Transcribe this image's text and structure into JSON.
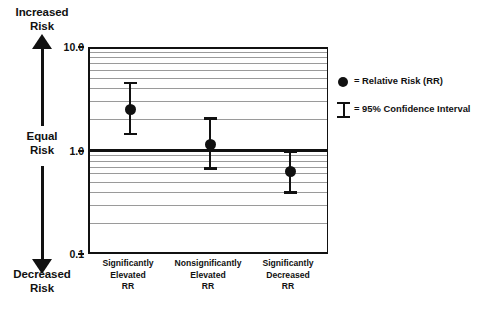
{
  "risk_axis": {
    "top_label": "Increased\nRisk",
    "top_label_line1": "Increased",
    "top_label_line2": "Risk",
    "mid_label_line1": "Equal",
    "mid_label_line2": "Risk",
    "bottom_label_line1": "Decreased",
    "bottom_label_line2": "Risk"
  },
  "legend": {
    "position": "right",
    "items": [
      {
        "symbol": "filled-circle",
        "label": "= Relative Risk (RR)"
      },
      {
        "symbol": "i-bar",
        "label": "= 95% Confidence Interval"
      }
    ]
  },
  "colors": {
    "ink": "#111111",
    "gridline": "#9a9a9a",
    "background": "#ffffff"
  },
  "chart_data": {
    "type": "scatter",
    "title": "",
    "subtitle": "",
    "xlabel": "",
    "ylabel": "",
    "scale": "log",
    "ylim": [
      0.1,
      10.0
    ],
    "grid": true,
    "reference_line": 1.0,
    "ytick_labels": [
      "10.0",
      "1.0",
      "0.1"
    ],
    "ytick_values": [
      10.0,
      1.0,
      0.1
    ],
    "categories": [
      "Significantly\nElevated\nRR",
      "Nonsignificantly\nElevated\nRR",
      "Significantly\nDecreased\nRR"
    ],
    "category_lines": [
      [
        "Significantly",
        "Elevated",
        "RR"
      ],
      [
        "Nonsignificantly",
        "Elevated",
        "RR"
      ],
      [
        "Significantly",
        "Decreased",
        "RR"
      ]
    ],
    "series": [
      {
        "name": "Relative Risk (RR)",
        "values": [
          2.5,
          1.15,
          0.62
        ],
        "ci_low": [
          1.4,
          0.65,
          0.38
        ],
        "ci_high": [
          4.6,
          2.1,
          1.0
        ]
      }
    ]
  }
}
